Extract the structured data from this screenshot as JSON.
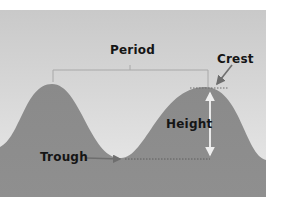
{
  "diagram": {
    "labels": {
      "period": "Period",
      "crest": "Crest",
      "height": "Height",
      "trough": "Trough"
    },
    "colors": {
      "sky_top": "#c9c9c9",
      "sky_bottom": "#e6e6e6",
      "wave": "#8f8f8f",
      "wave_dark": "#858585",
      "lines": "#a8a8a8",
      "arrow": "#6e6e6e",
      "height_arrow": "#eeeeee",
      "text": "#151515"
    }
  }
}
